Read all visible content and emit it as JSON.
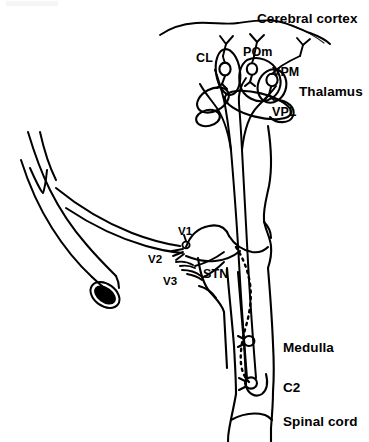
{
  "figure": {
    "width": 369,
    "height": 442,
    "background_color": "#ffffff",
    "ink_color": "#000000"
  },
  "labels": {
    "cerebral_cortex": "Cerebral cortex",
    "cl": "CL",
    "pom": "POm",
    "vpm": "VPM",
    "vpl": "VPL",
    "thalamus": "Thalamus",
    "v1": "V1",
    "v2": "V2",
    "v3": "V3",
    "stn": "STN",
    "medulla": "Medulla",
    "c2": "C2",
    "spinal_cord": "Spinal cord"
  },
  "structures": [
    {
      "id": "cerebral-cortex",
      "name": "Cerebral cortex",
      "label": "Cerebral cortex",
      "description": "Wavy cortical surface line across the top with three branching axon terminals ascending into it"
    },
    {
      "id": "thalamus",
      "name": "Thalamus",
      "label": "Thalamus",
      "description": "Cluster of overlapping oval nuclei below the cortex"
    },
    {
      "id": "nucleus-cl",
      "name": "Central lateral nucleus",
      "label": "CL",
      "description": "Thalamic nucleus, leftmost oval with a relay cell soma"
    },
    {
      "id": "nucleus-pom",
      "name": "Posterior medial nucleus",
      "label": "POm",
      "description": "Thalamic nucleus with a relay cell soma"
    },
    {
      "id": "nucleus-vpm",
      "name": "Ventral posteromedial nucleus",
      "label": "VPM",
      "description": "Thalamic nucleus with a relay cell soma receiving trigeminal input"
    },
    {
      "id": "nucleus-vpl",
      "name": "Ventral posterolateral nucleus",
      "label": "VPL",
      "description": "Thalamic nucleus lateral and inferior to VPM"
    },
    {
      "id": "trigeminal-nerve",
      "name": "Trigeminal nerve trunk",
      "label": "",
      "description": "Large cut nerve trunk entering from lower left with black filled lumen at the cut end"
    },
    {
      "id": "branch-v1",
      "name": "Ophthalmic division",
      "label": "V1",
      "description": "First trigeminal division branching at the ganglion node"
    },
    {
      "id": "branch-v2",
      "name": "Maxillary division",
      "label": "V2",
      "description": "Second trigeminal division"
    },
    {
      "id": "branch-v3",
      "name": "Mandibular division",
      "label": "V3",
      "description": "Third trigeminal division"
    },
    {
      "id": "stn",
      "name": "Spinal trigeminal nucleus",
      "label": "STN",
      "description": "Brainstem nucleus receiving descending trigeminal tract"
    },
    {
      "id": "medulla",
      "name": "Medulla",
      "label": "Medulla",
      "description": "Lower brainstem segment containing a second-order neuron soma"
    },
    {
      "id": "c2",
      "name": "C2 spinal segment",
      "label": "C2",
      "description": "Second cervical segment containing a second-order neuron soma"
    },
    {
      "id": "spinal-cord",
      "name": "Spinal cord",
      "label": "Spinal cord",
      "description": "Continuation of the neuraxis below C2"
    }
  ],
  "pathways": [
    {
      "id": "descending-trigeminal-tract",
      "name": "Descending trigeminal tract",
      "style": "dotted",
      "description": "Dotted line descending from the trigeminal entry zone through STN to the C2 soma"
    },
    {
      "id": "ascending-lemniscal-tract",
      "name": "Ascending trigeminothalamic tract",
      "style": "solid",
      "description": "Paired solid lines running from medulla and C2 upward to thalamic nuclei and on to cortex"
    }
  ]
}
